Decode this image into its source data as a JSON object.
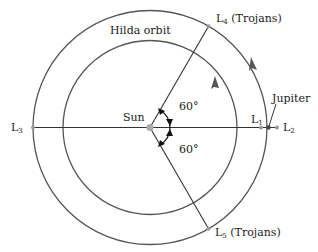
{
  "diagram": {
    "labels": {
      "hilda_orbit": "Hilda orbit",
      "sun": "Sun",
      "jupiter": "Jupiter",
      "l1": {
        "main": "L",
        "sub": "1"
      },
      "l2": {
        "main": "L",
        "sub": "2"
      },
      "l3": {
        "main": "L",
        "sub": "3"
      },
      "l4": {
        "main": "L",
        "sub": "4",
        "suffix": " (Trojans)"
      },
      "l5": {
        "main": "L",
        "sub": "5",
        "suffix": " (Trojans)"
      },
      "angle_upper": "60°",
      "angle_lower": "60°"
    },
    "angles_deg": {
      "l4_from_axis": 60,
      "l5_from_axis": -60
    },
    "colors": {
      "line": "#333333",
      "orbit": "#555555",
      "point": "#aaaaaa",
      "arrow": "#555555",
      "text": "#222222"
    }
  }
}
